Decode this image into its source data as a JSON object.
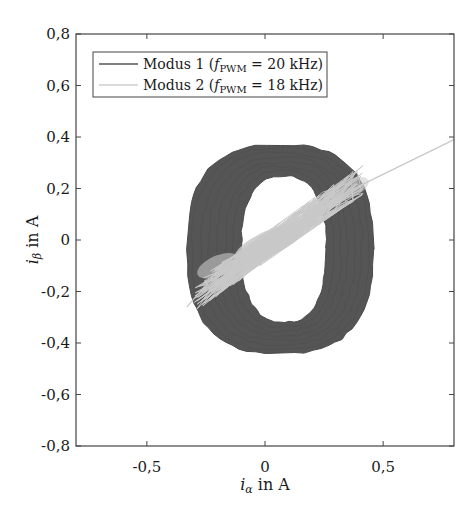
{
  "chart_data": {
    "type": "line",
    "title": "",
    "xlabel": "i_α in A",
    "ylabel": "i_β in A",
    "xlim": [
      -0.8,
      0.8
    ],
    "ylim": [
      -0.8,
      0.8
    ],
    "xticks": [
      -0.5,
      0,
      0.5
    ],
    "xtick_labels": [
      "-0,5",
      "0",
      "0,5"
    ],
    "yticks": [
      0.8,
      0.6,
      0.4,
      0.2,
      0,
      -0.2,
      -0.4,
      -0.6,
      -0.8
    ],
    "ytick_labels": [
      "0,8",
      "0,6",
      "0,4",
      "0,2",
      "0",
      "-0,2",
      "-0,4",
      "-0,6",
      "-0,8"
    ],
    "grid": false,
    "legend_position": "upper left",
    "series": [
      {
        "name": "Modus 1 (f_PWM = 20 kHz)",
        "color": "#555555",
        "shape": "thick elliptical current locus (ring)",
        "outer_bounds": {
          "x_min": -0.33,
          "x_max": 0.46,
          "y_min": -0.44,
          "y_max": 0.37
        },
        "inner_hole": {
          "x_min": -0.1,
          "x_max": 0.26,
          "y_min": -0.32,
          "y_max": 0.25
        },
        "center": [
          0.07,
          -0.03
        ]
      },
      {
        "name": "Modus 2 (f_PWM = 18 kHz)",
        "color": "#c8c8c8",
        "shape": "noisy linear trajectory along diagonal",
        "x": [
          -0.33,
          -0.2,
          -0.1,
          0.0,
          0.1,
          0.2,
          0.3,
          0.4,
          0.8
        ],
        "y": [
          -0.26,
          -0.12,
          -0.06,
          0.0,
          0.04,
          0.09,
          0.16,
          0.21,
          0.39
        ]
      }
    ]
  },
  "legend": {
    "entries": [
      {
        "prefix": "Modus 1 (",
        "sym": "f",
        "sub": "PWM",
        "suffix": " = 20 kHz)"
      },
      {
        "prefix": "Modus 2 (",
        "sym": "f",
        "sub": "PWM",
        "suffix": " = 18 kHz)"
      }
    ]
  },
  "axes": {
    "xlabel_main": "i",
    "xlabel_sub": "α",
    "xlabel_rest": " in A",
    "ylabel_main": "i",
    "ylabel_sub": "β",
    "ylabel_rest": " in A"
  }
}
